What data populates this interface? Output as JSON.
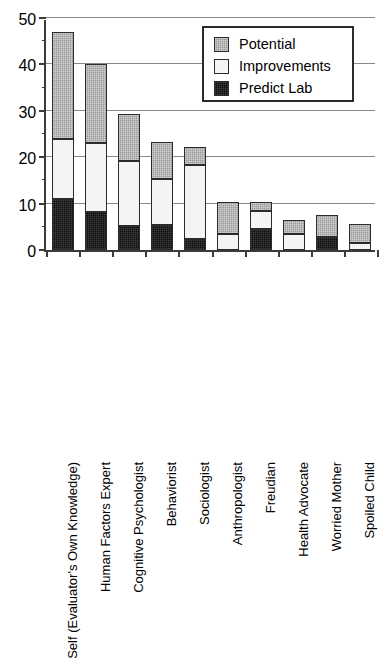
{
  "chart_data": {
    "type": "bar",
    "subtype": "stacked-vertical",
    "title": "",
    "xlabel": "",
    "ylabel": "",
    "ylim": [
      0,
      50
    ],
    "yticks": [
      0,
      10,
      20,
      30,
      40,
      50
    ],
    "ytick_labels": [
      "0",
      "10",
      "20",
      "30",
      "40",
      "50"
    ],
    "yminor_step": 5,
    "grid": "horizontal",
    "legend_position": "top-right",
    "categories": [
      "Self (Evaluator's Own Knowledge)",
      "Human Factors Expert",
      "Cognitive Psychologist",
      "Behaviorist",
      "Sociologist",
      "Anthropologist",
      "Freudian",
      "Health Advocate",
      "Worried Mother",
      "Spoiled Child"
    ],
    "series": [
      {
        "name": "Predict Lab",
        "color": "#0d0d0d",
        "values": [
          11,
          8.2,
          5.2,
          5.3,
          2.3,
          0,
          4.5,
          0,
          2.7,
          0
        ]
      },
      {
        "name": "Improvements",
        "color": "#f4f4f2",
        "values": [
          13,
          14.9,
          14,
          10,
          16,
          3.5,
          4,
          3.5,
          0,
          1.5
        ]
      },
      {
        "name": "Potential",
        "color": "#9a9a9a",
        "values": [
          23,
          17,
          10.1,
          8,
          4,
          6.8,
          1.9,
          3,
          4.8,
          4.2
        ]
      }
    ],
    "totals": [
      47,
      40.1,
      29.3,
      23.3,
      22.3,
      10.3,
      10.4,
      6.5,
      7.5,
      5.7
    ],
    "stack_order_bottom_to_top": [
      "Predict Lab",
      "Improvements",
      "Potential"
    ]
  },
  "legend": {
    "entries": [
      {
        "label": "Potential",
        "swatch": "potential-swatch"
      },
      {
        "label": "Improvements",
        "swatch": "improvements-swatch"
      },
      {
        "label": "Predict Lab",
        "swatch": "predict-lab-swatch"
      }
    ]
  },
  "colors": {
    "potential": "#9a9a9a",
    "improvements": "#f4f4f2",
    "predict_lab": "#0d0d0d",
    "axis": "#3b3b3b",
    "grid": "#8a8a8a",
    "background": "#ffffff"
  }
}
